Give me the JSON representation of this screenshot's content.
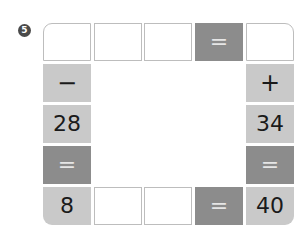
{
  "problem": {
    "number": "5"
  },
  "colors": {
    "light_cell": "#c9c9c9",
    "dark_cell": "#8c8c8c",
    "blank_border": "#bdbdbd",
    "badge": "#4a4a4a"
  },
  "top_row": [
    {
      "value": "",
      "type": "blank"
    },
    {
      "value": "",
      "type": "blank"
    },
    {
      "value": "",
      "type": "blank"
    },
    {
      "value": "=",
      "type": "dark"
    },
    {
      "value": "",
      "type": "blank"
    }
  ],
  "left_column": [
    {
      "value": "−",
      "type": "light"
    },
    {
      "value": "28",
      "type": "light"
    },
    {
      "value": "=",
      "type": "dark"
    }
  ],
  "right_column": [
    {
      "value": "+",
      "type": "light"
    },
    {
      "value": "34",
      "type": "light"
    },
    {
      "value": "=",
      "type": "dark"
    }
  ],
  "bottom_row": [
    {
      "value": "8",
      "type": "light"
    },
    {
      "value": "",
      "type": "blank"
    },
    {
      "value": "",
      "type": "blank"
    },
    {
      "value": "=",
      "type": "dark"
    },
    {
      "value": "40",
      "type": "light"
    }
  ]
}
